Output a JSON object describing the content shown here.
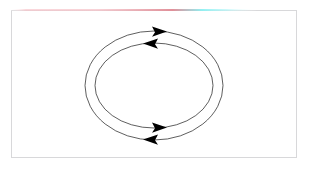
{
  "figure": {
    "title": "",
    "background_color": "#ffffff",
    "frame": {
      "name": "plot-frame",
      "border_color": "#d8d8da",
      "x": 11,
      "y": 10,
      "width": 286,
      "height": 148
    },
    "accent_line": {
      "name": "top-accent-line",
      "start_color": "#f6b8c0",
      "mid_color": "#e08b95",
      "end_color": "#8ef0f2",
      "fade_color": "#ffffff",
      "x": 11,
      "y": 9,
      "width": 245,
      "height": 2
    },
    "stroke_color": "#1a1a1a",
    "arrow_color": "#000000",
    "center_x": 154,
    "center_y": 85.5,
    "ellipses": [
      {
        "name": "outer-ellipse",
        "rx": 69,
        "ry": 54.5,
        "direction": "clockwise",
        "top_arrow": "right",
        "bottom_arrow": "left"
      },
      {
        "name": "inner-ellipse",
        "rx": 59,
        "ry": 42.5,
        "direction": "counter-clockwise",
        "top_arrow": "left",
        "bottom_arrow": "right"
      }
    ],
    "arrows": [
      {
        "name": "outer-top-arrow",
        "tip_x": 167,
        "tip_y": 31.6,
        "points": "right"
      },
      {
        "name": "inner-top-arrow",
        "tip_x": 143,
        "tip_y": 43.6,
        "points": "left"
      },
      {
        "name": "inner-bottom-arrow",
        "tip_x": 167,
        "tip_y": 127.6,
        "points": "right"
      },
      {
        "name": "outer-bottom-arrow",
        "tip_x": 143,
        "tip_y": 139.6,
        "points": "left"
      }
    ]
  }
}
